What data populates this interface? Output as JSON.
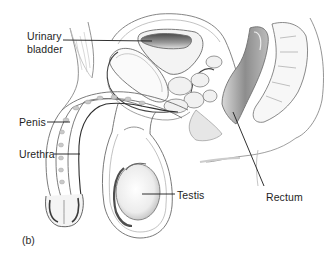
{
  "figure": {
    "panel_label": "(b)"
  },
  "labels": [
    {
      "id": "urinary-bladder",
      "line1": "Urinary",
      "line2": "bladder"
    },
    {
      "id": "penis",
      "text": "Penis"
    },
    {
      "id": "urethra",
      "text": "Urethra"
    },
    {
      "id": "testis",
      "text": "Testis"
    },
    {
      "id": "rectum",
      "text": "Rectum"
    }
  ],
  "colors": {
    "background": "#ffffff",
    "line": "#6f6f6f",
    "leader": "#1a1a1a",
    "shade_dark": "#5a5a5a",
    "shade_mid": "#a8a8a8",
    "shade_light": "#dcdcdc"
  }
}
